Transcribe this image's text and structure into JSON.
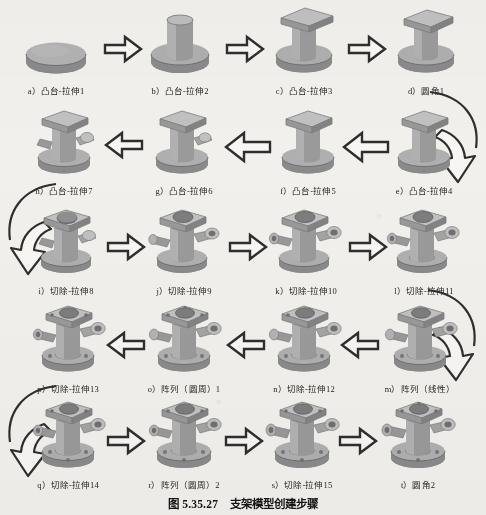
{
  "figure": {
    "caption_number": "图 5.35.27",
    "caption_title": "支架模型创建步骤",
    "rows": [
      {
        "direction": "left-to-right",
        "steps": [
          {
            "key": "a",
            "label": "a）凸台-拉伸1",
            "feature": "凸台-拉伸",
            "index": "1",
            "shape": "disc"
          },
          {
            "key": "b",
            "label": "b）凸台-拉伸2",
            "feature": "凸台-拉伸",
            "index": "2",
            "shape": "disc-with-cylinder"
          },
          {
            "key": "c",
            "label": "c）凸台-拉伸3",
            "feature": "凸台-拉伸",
            "index": "3",
            "shape": "disc-cylinder-square-top"
          },
          {
            "key": "d",
            "label": "d）圆角1",
            "feature": "圆角",
            "index": "1",
            "shape": "filleted-column"
          }
        ]
      },
      {
        "direction": "right-to-left",
        "steps": [
          {
            "key": "e",
            "label": "e）凸台-拉伸4",
            "feature": "凸台-拉伸",
            "index": "4",
            "shape": "column-square-top"
          },
          {
            "key": "f",
            "label": "f）凸台-拉伸5",
            "feature": "凸台-拉伸",
            "index": "5",
            "shape": "column-square-top-2"
          },
          {
            "key": "g",
            "label": "g）凸台-拉伸6",
            "feature": "凸台-拉伸",
            "index": "6",
            "shape": "column-with-side-boss"
          },
          {
            "key": "h",
            "label": "h）凸台-拉伸7",
            "feature": "凸台-拉伸",
            "index": "7",
            "shape": "column-two-side-bosses"
          }
        ]
      },
      {
        "direction": "left-to-right",
        "steps": [
          {
            "key": "i",
            "label": "i）切除-拉伸8",
            "feature": "切除-拉伸",
            "index": "8",
            "shape": "cut-top-bore"
          },
          {
            "key": "j",
            "label": "j）切除-拉伸9",
            "feature": "切除-拉伸",
            "index": "9",
            "shape": "cut-side-bore"
          },
          {
            "key": "k",
            "label": "k）切除-拉伸10",
            "feature": "切除-拉伸",
            "index": "10",
            "shape": "cut-second-side-bore"
          },
          {
            "key": "l",
            "label": "l）切除-拉伸11",
            "feature": "切除-拉伸",
            "index": "11",
            "shape": "cut-flange-bore"
          }
        ]
      },
      {
        "direction": "right-to-left",
        "steps": [
          {
            "key": "m",
            "label": "m）阵列（线性）",
            "feature": "阵列（线性）",
            "index": "",
            "shape": "linear-pattern"
          },
          {
            "key": "n",
            "label": "n）切除-拉伸12",
            "feature": "切除-拉伸",
            "index": "12",
            "shape": "cut-12"
          },
          {
            "key": "o",
            "label": "o）阵列（圆周）1",
            "feature": "阵列（圆周）",
            "index": "1",
            "shape": "circular-pattern-1"
          },
          {
            "key": "p",
            "label": "p）切除-拉伸13",
            "feature": "切除-拉伸",
            "index": "13",
            "shape": "cut-13"
          }
        ]
      },
      {
        "direction": "left-to-right",
        "steps": [
          {
            "key": "q",
            "label": "q）切除-拉伸14",
            "feature": "切除-拉伸",
            "index": "14",
            "shape": "cut-14"
          },
          {
            "key": "r",
            "label": "r）阵列（圆周）2",
            "feature": "阵列（圆周）",
            "index": "2",
            "shape": "circular-pattern-2"
          },
          {
            "key": "s",
            "label": "s）切除-拉伸15",
            "feature": "切除-拉伸",
            "index": "15",
            "shape": "cut-15"
          },
          {
            "key": "t",
            "label": "t）圆角2",
            "feature": "圆角",
            "index": "2",
            "shape": "final-bracket"
          }
        ]
      }
    ],
    "connectors": {
      "straight_arrow": "block-arrow",
      "wrap_right_label": "wrap-arrow-right",
      "wrap_left_label": "wrap-arrow-left"
    },
    "colors": {
      "page_background": "#f2f0ec",
      "part_light": "#b9b9b9",
      "part_mid": "#9d9d9d",
      "part_dark": "#767676",
      "outline": "#4a4a4a",
      "arrow_fill": "#fbfaf7",
      "arrow_stroke": "#2b2b2b",
      "text": "#1a1a1a"
    }
  }
}
